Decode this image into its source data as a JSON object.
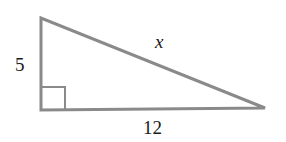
{
  "diagram": {
    "type": "right-triangle",
    "line_color": "#8a8a8a",
    "vertices": {
      "top": [
        41,
        18
      ],
      "right_angle": [
        41,
        110
      ],
      "right": [
        265,
        108
      ]
    },
    "labels": {
      "vertical_leg": "5",
      "hypotenuse": "x",
      "horizontal_leg": "12"
    },
    "right_angle_marker": true
  }
}
